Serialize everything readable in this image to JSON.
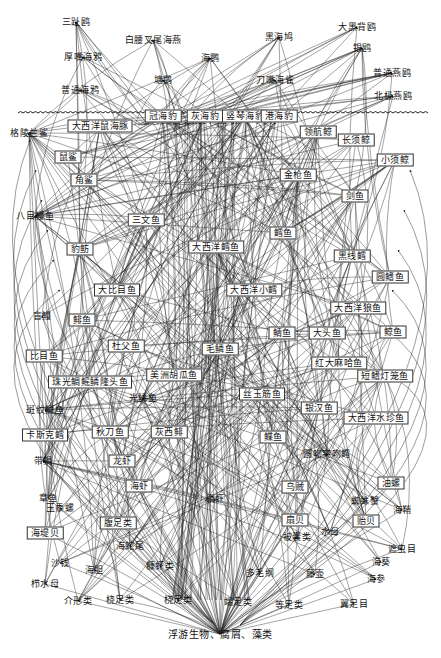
{
  "diagram": {
    "title": "",
    "type": "marine food web",
    "colors": {
      "line": "#222222",
      "background": "#ffffff",
      "text": "#111111"
    },
    "seabirds": [
      {
        "id": "sanzhiou",
        "label": "三趾鸥",
        "x": 76,
        "y": 22,
        "boxed": false
      },
      {
        "id": "baiyao",
        "label": "白腰叉尾海燕",
        "x": 153,
        "y": 40,
        "boxed": false
      },
      {
        "id": "houzui",
        "label": "厚嘴海鸦",
        "x": 83,
        "y": 57,
        "boxed": false
      },
      {
        "id": "putonghaiya",
        "label": "普通海鸦",
        "x": 80,
        "y": 90,
        "boxed": false
      },
      {
        "id": "haiou",
        "label": "海鹦",
        "x": 210,
        "y": 58,
        "boxed": false
      },
      {
        "id": "tihu",
        "label": "塘鹅",
        "x": 163,
        "y": 80,
        "boxed": false
      },
      {
        "id": "heihaiya",
        "label": "黑海鸠",
        "x": 279,
        "y": 37,
        "boxed": false
      },
      {
        "id": "daoqiao",
        "label": "刀嘴海雀",
        "x": 275,
        "y": 80,
        "boxed": false
      },
      {
        "id": "daheibei",
        "label": "大黑背鸥",
        "x": 357,
        "y": 27,
        "boxed": false
      },
      {
        "id": "yinou",
        "label": "银鸥",
        "x": 362,
        "y": 48,
        "boxed": false
      },
      {
        "id": "putongyanou",
        "label": "普通燕鸥",
        "x": 392,
        "y": 73,
        "boxed": false
      },
      {
        "id": "beijiyanou",
        "label": "北极燕鸥",
        "x": 393,
        "y": 96,
        "boxed": false
      }
    ],
    "mammals": [
      {
        "id": "guanhaibao",
        "label": "冠海豹",
        "x": 163,
        "y": 116,
        "boxed": true
      },
      {
        "id": "huihaibao",
        "label": "灰海豹",
        "x": 205,
        "y": 116,
        "boxed": true
      },
      {
        "id": "qinlan",
        "label": "竖琴海豹",
        "x": 245,
        "y": 116,
        "boxed": true
      },
      {
        "id": "ganghaibao",
        "label": "港海豹",
        "x": 279,
        "y": 116,
        "boxed": true
      },
      {
        "id": "daxiyangshuhaitun",
        "label": "大西洋鼠海豚",
        "x": 100,
        "y": 126,
        "boxed": true
      },
      {
        "id": "zuohangjing",
        "label": "领航鲸",
        "x": 318,
        "y": 132,
        "boxed": true
      },
      {
        "id": "changxujing",
        "label": "长须鲸",
        "x": 356,
        "y": 140,
        "boxed": true
      },
      {
        "id": "xiaoxujing",
        "label": "小须鲸",
        "x": 395,
        "y": 160,
        "boxed": true
      }
    ],
    "fishes": [
      {
        "id": "gelinglan",
        "label": "格陵兰鲨",
        "x": 29,
        "y": 133,
        "boxed": false
      },
      {
        "id": "shusha",
        "label": "鼠鲨",
        "x": 68,
        "y": 157,
        "boxed": true
      },
      {
        "id": "jiaosha",
        "label": "角鲨",
        "x": 84,
        "y": 180,
        "boxed": true
      },
      {
        "id": "jinqiangyu",
        "label": "金枪鱼",
        "x": 298,
        "y": 175,
        "boxed": true
      },
      {
        "id": "jianyu",
        "label": "剑鱼",
        "x": 355,
        "y": 196,
        "boxed": true
      },
      {
        "id": "sanwenyu",
        "label": "三文鱼",
        "x": 146,
        "y": 220,
        "boxed": true
      },
      {
        "id": "bamuman",
        "label": "八目鳗鱼",
        "x": 35,
        "y": 216,
        "boxed": false
      },
      {
        "id": "xueyu",
        "label": "鳕鱼",
        "x": 283,
        "y": 233,
        "boxed": true
      },
      {
        "id": "baoji",
        "label": "豹鲂",
        "x": 80,
        "y": 249,
        "boxed": true
      },
      {
        "id": "daxiyangxueyu",
        "label": "大西洋鳕鱼",
        "x": 216,
        "y": 247,
        "boxed": true
      },
      {
        "id": "heixianxue",
        "label": "黑线鳕",
        "x": 352,
        "y": 256,
        "boxed": true
      },
      {
        "id": "yuanqiyu",
        "label": "圆鳍鱼",
        "x": 390,
        "y": 277,
        "boxed": true
      },
      {
        "id": "dabimuyu",
        "label": "大比目鱼",
        "x": 117,
        "y": 290,
        "boxed": true
      },
      {
        "id": "daxiyangxiaoxue",
        "label": "大西洋小鳕",
        "x": 254,
        "y": 290,
        "boxed": true
      },
      {
        "id": "mangman",
        "label": "盲鳗",
        "x": 42,
        "y": 316,
        "boxed": false
      },
      {
        "id": "ningyu",
        "label": "鲱鱼",
        "x": 82,
        "y": 320,
        "boxed": true
      },
      {
        "id": "daxiyanglangyu",
        "label": "大西洋狼鱼",
        "x": 358,
        "y": 308,
        "boxed": true
      },
      {
        "id": "maoxuan",
        "label": "毛鳞鱼",
        "x": 220,
        "y": 349,
        "boxed": true
      },
      {
        "id": "xuyu",
        "label": "鲭鱼",
        "x": 282,
        "y": 333,
        "boxed": true
      },
      {
        "id": "datouyu",
        "label": "大头鱼",
        "x": 327,
        "y": 333,
        "boxed": true
      },
      {
        "id": "xiangyu",
        "label": "鲸鱼",
        "x": 393,
        "y": 332,
        "boxed": true
      },
      {
        "id": "bimuyu",
        "label": "比目鱼",
        "x": 44,
        "y": 356,
        "boxed": true
      },
      {
        "id": "dufuyu",
        "label": "杜父鱼",
        "x": 126,
        "y": 346,
        "boxed": true
      },
      {
        "id": "hongdamaha",
        "label": "红大麻哈鱼",
        "x": 339,
        "y": 363,
        "boxed": true
      },
      {
        "id": "meizhouhuguayu",
        "label": "美洲胡瓜鱼",
        "x": 174,
        "y": 375,
        "boxed": true
      },
      {
        "id": "zhuguangdenglong",
        "label": "短鳍灯笼鱼",
        "x": 385,
        "y": 376,
        "boxed": true
      },
      {
        "id": "zhujiaoyu",
        "label": "珠光鲷鳐鳞隆头鱼",
        "x": 90,
        "y": 382,
        "boxed": true
      },
      {
        "id": "guangxueyu",
        "label": "光鳞鱼",
        "x": 143,
        "y": 398,
        "boxed": false
      },
      {
        "id": "siyujinyu",
        "label": "丝玉筋鱼",
        "x": 262,
        "y": 394,
        "boxed": true
      },
      {
        "id": "banwenlanyu",
        "label": "斑纹鳚鱼",
        "x": 45,
        "y": 410,
        "boxed": false
      },
      {
        "id": "yinhanyu",
        "label": "银汉鱼",
        "x": 319,
        "y": 408,
        "boxed": true
      },
      {
        "id": "daxiyangshuizhenyu",
        "label": "大西洋水珍鱼",
        "x": 376,
        "y": 418,
        "boxed": true
      },
      {
        "id": "kasikexueyu",
        "label": "卡斯克鳕",
        "x": 45,
        "y": 435,
        "boxed": true
      },
      {
        "id": "qiudaoyu",
        "label": "秋刀鱼",
        "x": 110,
        "y": 432,
        "boxed": true
      },
      {
        "id": "huixiyu",
        "label": "灰西鲱",
        "x": 169,
        "y": 432,
        "boxed": true
      },
      {
        "id": "diaoyu",
        "label": "鲽鱼",
        "x": 273,
        "y": 437,
        "boxed": true
      },
      {
        "id": "daiyu",
        "label": "带鲷",
        "x": 43,
        "y": 461,
        "boxed": false
      },
      {
        "id": "shuihuxie",
        "label": "圆吻突吻鳕",
        "x": 327,
        "y": 454,
        "boxed": false
      }
    ],
    "invertebrates": [
      {
        "id": "longxia",
        "label": "龙虾",
        "x": 122,
        "y": 461,
        "boxed": true
      },
      {
        "id": "haixia",
        "label": "海虾",
        "x": 139,
        "y": 486,
        "boxed": true
      },
      {
        "id": "zhangyu",
        "label": "章鱼",
        "x": 48,
        "y": 498,
        "boxed": false
      },
      {
        "id": "wuzei",
        "label": "乌贼",
        "x": 295,
        "y": 487,
        "boxed": true
      },
      {
        "id": "youluo",
        "label": "油螺",
        "x": 391,
        "y": 483,
        "boxed": true
      },
      {
        "id": "yutailuo",
        "label": "玉黍螺",
        "x": 60,
        "y": 508,
        "boxed": false
      },
      {
        "id": "linxia",
        "label": "磷虾",
        "x": 215,
        "y": 499,
        "boxed": false
      },
      {
        "id": "zhizhuxie",
        "label": "蜘蛛蟹",
        "x": 365,
        "y": 501,
        "boxed": false
      },
      {
        "id": "fuzulei",
        "label": "腹足类",
        "x": 118,
        "y": 523,
        "boxed": true
      },
      {
        "id": "shanbei",
        "label": "扇贝",
        "x": 295,
        "y": 520,
        "boxed": true
      },
      {
        "id": "haiqiao",
        "label": "海鞘",
        "x": 402,
        "y": 510,
        "boxed": false
      },
      {
        "id": "haidibei",
        "label": "海堤贝",
        "x": 45,
        "y": 533,
        "boxed": true
      },
      {
        "id": "yibei",
        "label": "贻贝",
        "x": 366,
        "y": 521,
        "boxed": true
      },
      {
        "id": "haishewei",
        "label": "海蛇尾",
        "x": 130,
        "y": 546,
        "boxed": false
      },
      {
        "id": "beiguan",
        "label": "被囊类",
        "x": 297,
        "y": 537,
        "boxed": false
      },
      {
        "id": "shuimu",
        "label": "水母",
        "x": 330,
        "y": 532,
        "boxed": false
      },
      {
        "id": "shaqian",
        "label": "沙钱",
        "x": 60,
        "y": 563,
        "boxed": false
      },
      {
        "id": "haidan",
        "label": "海胆",
        "x": 94,
        "y": 570,
        "boxed": false
      },
      {
        "id": "suoxialei",
        "label": "糠虾类",
        "x": 160,
        "y": 566,
        "boxed": false
      },
      {
        "id": "duomao",
        "label": "多毛纲",
        "x": 260,
        "y": 573,
        "boxed": false
      },
      {
        "id": "tenghu",
        "label": "藤壶",
        "x": 315,
        "y": 574,
        "boxed": false
      },
      {
        "id": "zhuchong",
        "label": "遮虫目",
        "x": 402,
        "y": 549,
        "boxed": false
      },
      {
        "id": "haikui",
        "label": "海葵",
        "x": 381,
        "y": 562,
        "boxed": false
      },
      {
        "id": "haishen",
        "label": "海参",
        "x": 376,
        "y": 579,
        "boxed": false
      },
      {
        "id": "zhishuimu",
        "label": "栉水母",
        "x": 45,
        "y": 584,
        "boxed": false
      },
      {
        "id": "jiexinglei",
        "label": "介形类",
        "x": 78,
        "y": 601,
        "boxed": false
      },
      {
        "id": "sizulei",
        "label": "桡足类",
        "x": 120,
        "y": 600,
        "boxed": false
      },
      {
        "id": "naozulei",
        "label": "桡足类",
        "x": 178,
        "y": 600,
        "boxed": false
      },
      {
        "id": "duanzulei",
        "label": "端足类",
        "x": 238,
        "y": 602,
        "boxed": false
      },
      {
        "id": "dengzulei",
        "label": "等足类",
        "x": 289,
        "y": 605,
        "boxed": false
      },
      {
        "id": "yizumu",
        "label": "翼足目",
        "x": 354,
        "y": 604,
        "boxed": false
      }
    ],
    "base": {
      "id": "base",
      "label": "浮游生物、腐屑、藻类",
      "x": 220,
      "y": 634
    },
    "surface": {
      "y": 113,
      "x_start": 18,
      "x_end": 424
    }
  }
}
